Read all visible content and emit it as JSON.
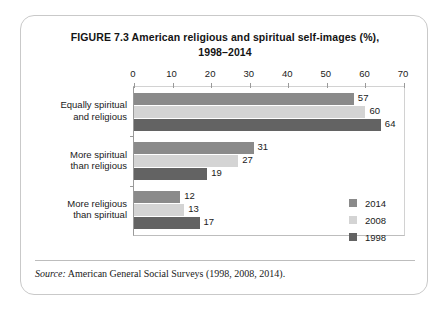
{
  "figure": {
    "title_line1": "FIGURE 7.3  American religious and spiritual self-images (%),",
    "title_line2": "1998–2014",
    "source_label": "Source:",
    "source_text": "American General Social Surveys (1998, 2008, 2014)."
  },
  "chart_data": {
    "type": "bar",
    "orientation": "horizontal",
    "title": "FIGURE 7.3  American religious and spiritual self-images (%), 1998–2014",
    "xlabel": "",
    "ylabel": "",
    "xlim": [
      0,
      70
    ],
    "xticks": [
      0,
      10,
      20,
      30,
      40,
      50,
      60,
      70
    ],
    "grid": false,
    "legend_position": "right",
    "categories": [
      "Equally spiritual and religious",
      "More spiritual than religious",
      "More religious than spiritual"
    ],
    "category_lines": [
      [
        "Equally spiritual",
        "and religious"
      ],
      [
        "More spiritual",
        "than religious"
      ],
      [
        "More religious",
        "than spiritual"
      ]
    ],
    "series": [
      {
        "name": "2014",
        "color": "#8a8a8a",
        "values": [
          57,
          31,
          12
        ]
      },
      {
        "name": "2008",
        "color": "#d4d4d4",
        "values": [
          60,
          27,
          13
        ]
      },
      {
        "name": "1998",
        "color": "#636363",
        "values": [
          64,
          19,
          17
        ]
      }
    ]
  }
}
